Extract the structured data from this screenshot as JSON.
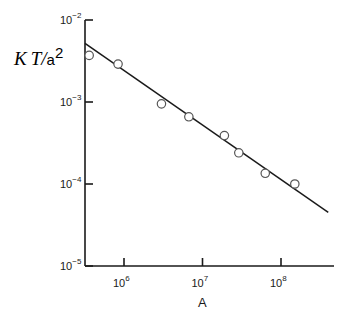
{
  "chart_data": {
    "type": "scatter",
    "title": "",
    "xlabel": "A",
    "ylabel": "K T/a²",
    "ylabel_parts": {
      "k": "K",
      "t": "T",
      "slash": "/",
      "a": "a",
      "exp": "2"
    },
    "xscale": "log",
    "yscale": "log",
    "xlim": [
      320000.0,
      500000000.0
    ],
    "ylim": [
      1e-05,
      0.01
    ],
    "grid": false,
    "legend": null,
    "x_ticks": [
      {
        "base": "10",
        "exp": "6",
        "value": 1000000.0
      },
      {
        "base": "10",
        "exp": "7",
        "value": 10000000.0
      },
      {
        "base": "10",
        "exp": "8",
        "value": 100000000.0
      }
    ],
    "y_ticks": [
      {
        "base": "10",
        "exp": "-2",
        "value": 0.01
      },
      {
        "base": "10",
        "exp": "-3",
        "value": 0.001
      },
      {
        "base": "10",
        "exp": "-4",
        "value": 0.0001
      },
      {
        "base": "10",
        "exp": "-5",
        "value": 1e-05
      }
    ],
    "series": [
      {
        "name": "measured",
        "marker": "open-circle",
        "x": [
          360000.0,
          840000.0,
          3000000.0,
          6700000.0,
          19000000.0,
          29000000.0,
          63000000.0,
          150000000.0
        ],
        "y": [
          0.0037,
          0.0029,
          0.00095,
          0.00066,
          0.00039,
          0.00024,
          0.000135,
          0.0001
        ]
      },
      {
        "name": "fit line",
        "style": "solid-line",
        "x": [
          320000.0,
          400000000.0
        ],
        "y": [
          0.0052,
          4.5e-05
        ]
      }
    ]
  }
}
